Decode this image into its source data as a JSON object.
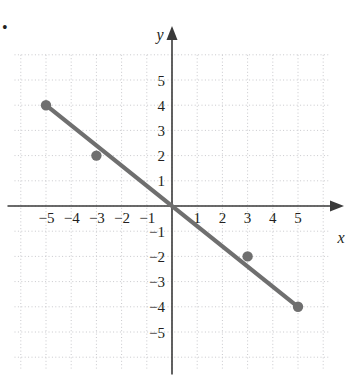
{
  "figure": {
    "marker_label": "•",
    "background": "#ffffff"
  },
  "colors": {
    "line": "#6f6f6f",
    "point": "#6f6f6f",
    "axis": "#3a3a3a",
    "grid": "#c8c8cc",
    "text": "#231f20"
  },
  "chart_data": {
    "type": "line",
    "title": "",
    "xlabel": "x",
    "ylabel": "y",
    "xlim": [
      -6.3,
      6.4
    ],
    "ylim": [
      -6.5,
      6.1
    ],
    "grid": true,
    "grid_step": 1,
    "legend": "none",
    "equation": "y = -0.8x",
    "slope": -0.8,
    "intercept": 0,
    "xticks": [
      -5,
      -4,
      -3,
      -2,
      -1,
      1,
      2,
      3,
      4,
      5
    ],
    "yticks": [
      5,
      4,
      3,
      2,
      1,
      -1,
      -2,
      -3,
      -4,
      -5
    ],
    "xtick_labels": [
      "−5",
      "−4",
      "−3",
      "−2",
      "−1",
      "1",
      "2",
      "3",
      "4",
      "5"
    ],
    "ytick_labels": [
      "5",
      "4",
      "3",
      "2",
      "1",
      "−1",
      "−2",
      "−3",
      "−4",
      "−5"
    ],
    "series": [
      {
        "name": "line",
        "x": [
          -5,
          5
        ],
        "y": [
          4,
          -4
        ]
      }
    ],
    "points": [
      {
        "x": -5,
        "y": 4,
        "label": "(−5, 4)"
      },
      {
        "x": -3,
        "y": 2,
        "label": "(−3, 2)"
      },
      {
        "x": 3,
        "y": -2,
        "label": "(3, −2)"
      },
      {
        "x": 5,
        "y": -4,
        "label": "(5, −4)"
      }
    ]
  }
}
